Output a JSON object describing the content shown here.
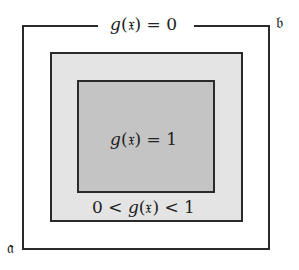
{
  "diagram": {
    "regions": [
      {
        "id": "outer",
        "label_text": "g(𝔵) = 0",
        "fill": "#ffffff",
        "border": "#2a2a2a"
      },
      {
        "id": "middle",
        "label_text": "0 < g(𝔵) < 1",
        "fill": "#e4e4e4",
        "border": "#2a2a2a"
      },
      {
        "id": "inner",
        "label_text": "g(𝔵) = 1",
        "fill": "#c4c4c4",
        "border": "#2a2a2a"
      }
    ],
    "labels": {
      "zero": {
        "pre": "",
        "fn": "g",
        "arg": "(𝔵)",
        "post": " = 0"
      },
      "one": {
        "pre": "",
        "fn": "g",
        "arg": "(𝔵)",
        "post": " = 1"
      },
      "mid": {
        "pre": "0 < ",
        "fn": "g",
        "arg": "(𝔵)",
        "post": " < 1"
      }
    },
    "corners": {
      "a": "𝔞",
      "b": "𝔟"
    }
  }
}
